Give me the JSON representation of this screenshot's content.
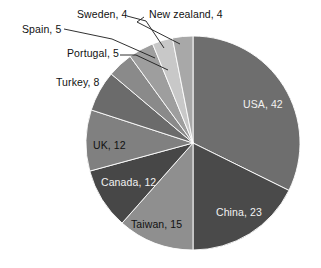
{
  "chart_data": {
    "type": "pie",
    "title": "",
    "subtitle": "",
    "xlabel": "",
    "ylabel": "",
    "legend_position": "none",
    "grid": false,
    "total": 130,
    "start_angle_deg": 0,
    "direction": "clockwise",
    "center": {
      "x": 193,
      "y": 143
    },
    "radius": 107,
    "categories": [
      "USA",
      "China",
      "Taiwan",
      "Canada",
      "UK",
      "Turkey",
      "Portugal",
      "Spain",
      "Sweden",
      "New zealand"
    ],
    "values": [
      42,
      23,
      15,
      12,
      12,
      8,
      5,
      5,
      4,
      4
    ],
    "labels": [
      "USA, 42",
      "China, 23",
      "Taiwan, 15",
      "Canada, 12",
      "UK, 12",
      "Turkey, 8",
      "Portugal, 5",
      "Spain, 5",
      "Sweden, 4",
      "New zealand, 4"
    ],
    "colors": [
      "#6e6e6e",
      "#4a4a4a",
      "#8f8f8f",
      "#474747",
      "#808080",
      "#6b6b6b",
      "#8a8a8a",
      "#9e9e9e",
      "#c8c8c8",
      "#a8a8a8"
    ],
    "slices": [
      {
        "name": "USA",
        "value": 42,
        "label": "USA, 42",
        "color": "#6e6e6e",
        "label_placement": "inside",
        "label_color": "light",
        "label_x": 243,
        "label_y": 99
      },
      {
        "name": "China",
        "value": 23,
        "label": "China, 23",
        "color": "#4a4a4a",
        "label_placement": "inside",
        "label_color": "light",
        "label_x": 216,
        "label_y": 207
      },
      {
        "name": "Taiwan",
        "value": 15,
        "label": "Taiwan, 15",
        "color": "#8f8f8f",
        "label_placement": "inside",
        "label_color": "dark",
        "label_x": 131,
        "label_y": 219
      },
      {
        "name": "Canada",
        "value": 12,
        "label": "Canada, 12",
        "color": "#474747",
        "label_placement": "inside",
        "label_color": "light",
        "label_x": 101,
        "label_y": 177
      },
      {
        "name": "UK",
        "value": 12,
        "label": "UK, 12",
        "color": "#808080",
        "label_placement": "inside",
        "label_color": "dark",
        "label_x": 93,
        "label_y": 140
      },
      {
        "name": "Turkey",
        "value": 8,
        "label": "Turkey, 8",
        "color": "#6b6b6b",
        "label_placement": "outside",
        "label_color": "dark",
        "label_x": 56,
        "label_y": 77
      },
      {
        "name": "Portugal",
        "value": 5,
        "label": "Portugal, 5",
        "color": "#8a8a8a",
        "label_placement": "outside",
        "label_color": "dark",
        "label_x": 67,
        "label_y": 48
      },
      {
        "name": "Spain",
        "value": 5,
        "label": "Spain, 5",
        "color": "#9e9e9e",
        "label_placement": "outside",
        "label_color": "dark",
        "label_x": 22,
        "label_y": 24
      },
      {
        "name": "Sweden",
        "value": 4,
        "label": "Sweden, 4",
        "color": "#c8c8c8",
        "label_placement": "outside",
        "label_color": "dark",
        "label_x": 77,
        "label_y": 9
      },
      {
        "name": "New zealand",
        "value": 4,
        "label": "New zealand, 4",
        "color": "#a8a8a8",
        "label_placement": "outside",
        "label_color": "dark",
        "label_x": 149,
        "label_y": 9
      }
    ],
    "leader_lines": [
      {
        "name": "spain",
        "points": "64,29 112,39 155,58"
      },
      {
        "name": "sweden",
        "points": "127,16 146,21 164,48"
      },
      {
        "name": "portugal",
        "points": "120,55 136,55 168,70"
      },
      {
        "name": "new-zealand",
        "points": "144,17 137,22 180,44"
      }
    ]
  }
}
